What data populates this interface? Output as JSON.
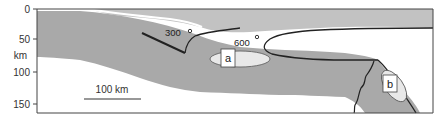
{
  "figure": {
    "type": "geological cross-section",
    "colors": {
      "slab": "#a9a9a9",
      "upper_plate": "#c2c2c2",
      "mantle_wedge": "#ffffff",
      "ellipse_fill": "#e8e8e8",
      "lines": "#222222",
      "frame": "#444444"
    }
  },
  "y_axis": {
    "unit_label": "km",
    "ticks": [
      {
        "value": "0",
        "y": 9
      },
      {
        "value": "50",
        "y": 39
      },
      {
        "value": "100",
        "y": 72
      },
      {
        "value": "150",
        "y": 104
      }
    ]
  },
  "isotherms": [
    {
      "label": "300",
      "degree_symbol": "o"
    },
    {
      "label": "600",
      "degree_symbol": "o"
    }
  ],
  "zones": [
    {
      "label": "a"
    },
    {
      "label": "b"
    }
  ],
  "scale_bar": {
    "label": "100 km"
  }
}
